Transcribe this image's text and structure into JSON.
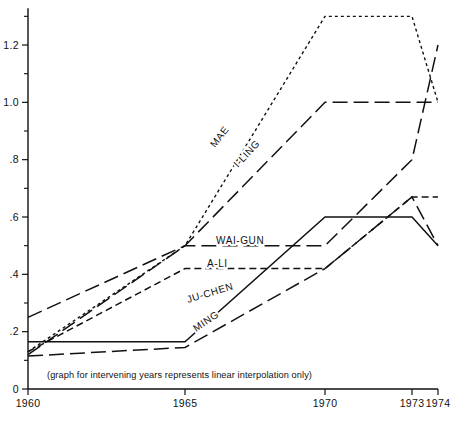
{
  "chart_data": {
    "type": "line",
    "title": "",
    "subtitle": "",
    "xlabel": "",
    "ylabel": "",
    "note": "(graph for intervening years represents linear interpolation only)",
    "grid": false,
    "legend_position": "inline-labels",
    "x": [
      1960,
      1965,
      1970,
      1973,
      1974
    ],
    "xticklabels": [
      "1960",
      "1965",
      "1970",
      "1973",
      "1974"
    ],
    "xlim": [
      1960,
      1974
    ],
    "ylim": [
      0,
      1.3
    ],
    "yticks": [
      0,
      0.2,
      0.4,
      0.6,
      0.8,
      1.0,
      1.2
    ],
    "yticklabels": [
      "0",
      ".2",
      ".4",
      ".6",
      ".8",
      "1.0",
      "1.2"
    ],
    "yminorticks": [
      0.1,
      0.3,
      0.5,
      0.7,
      0.9,
      1.1,
      1.3
    ],
    "series": [
      {
        "name": "MAE",
        "dash": "dotted",
        "label": "MAE",
        "values": [
          0.13,
          0.5,
          1.3,
          1.3,
          1.0
        ]
      },
      {
        "name": "I-LING",
        "dash": "long-dash",
        "label": "I-LING",
        "values": [
          0.12,
          0.5,
          1.0,
          1.0,
          1.0
        ]
      },
      {
        "name": "WAI-GUN",
        "dash": "long-dash",
        "label": "WAI-GUN",
        "values": [
          0.25,
          0.5,
          0.5,
          0.8,
          1.2
        ]
      },
      {
        "name": "A-LI",
        "dash": "short-dash",
        "label": "A-LI",
        "values": [
          0.13,
          0.42,
          0.42,
          0.67,
          0.67
        ]
      },
      {
        "name": "JU-CHEN",
        "dash": "solid",
        "label": "JU-CHEN",
        "values": [
          0.165,
          0.165,
          0.6,
          0.6,
          0.5
        ]
      },
      {
        "name": "MING",
        "dash": "long-dash",
        "label": "MING",
        "values": [
          0.115,
          0.145,
          0.42,
          0.67,
          0.5
        ]
      }
    ],
    "series_label_positions": [
      {
        "name": "MAE",
        "x": 215,
        "y": 148,
        "rotate": -52
      },
      {
        "name": "I-LING",
        "x": 238,
        "y": 168,
        "rotate": -47
      },
      {
        "name": "WAI-GUN",
        "x": 216,
        "y": 244,
        "rotate": 0
      },
      {
        "name": "A-LI",
        "x": 207,
        "y": 267,
        "rotate": 0
      },
      {
        "name": "JU-CHEN",
        "x": 188,
        "y": 303,
        "rotate": -17
      },
      {
        "name": "MING",
        "x": 196,
        "y": 332,
        "rotate": -34
      }
    ]
  }
}
